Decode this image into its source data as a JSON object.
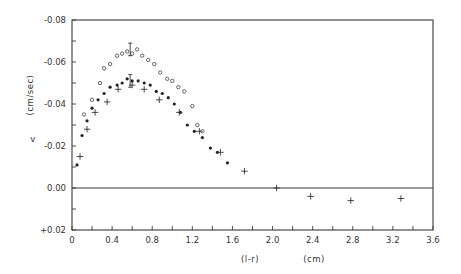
{
  "chart_data": {
    "type": "scatter",
    "title": "",
    "xlabel": "(l-r)",
    "xlabel_units": "(cm)",
    "ylabel": "v",
    "ylabel_units": "(cm/sec)",
    "xlim": [
      0,
      3.6
    ],
    "ylim": [
      0.02,
      -0.08
    ],
    "xticks": [
      0,
      0.4,
      0.8,
      1.2,
      1.6,
      2.0,
      2.4,
      2.8,
      3.2,
      3.6
    ],
    "xtick_labels": [
      "0",
      "0.4",
      "0.8",
      "1.2",
      "1.6",
      "2.0",
      "2.4",
      "2.8",
      "3.2",
      "3.6"
    ],
    "yticks": [
      -0.08,
      -0.06,
      -0.04,
      -0.02,
      0.0,
      0.02
    ],
    "ytick_labels": [
      "-0.08",
      "-0.06",
      "-0.04",
      "-0.02",
      "0.00",
      "+0.02"
    ],
    "grid": false,
    "zero_line": true,
    "legend": null,
    "series": [
      {
        "name": "open circles",
        "marker": "open-circle",
        "x": [
          0.12,
          0.2,
          0.28,
          0.32,
          0.38,
          0.45,
          0.5,
          0.55,
          0.6,
          0.65,
          0.7,
          0.76,
          0.82,
          0.88,
          0.95,
          1.0,
          1.06,
          1.12,
          1.2,
          1.25,
          1.3
        ],
        "y": [
          -0.035,
          -0.042,
          -0.05,
          -0.057,
          -0.059,
          -0.063,
          -0.064,
          -0.065,
          -0.064,
          -0.066,
          -0.063,
          -0.061,
          -0.059,
          -0.055,
          -0.052,
          -0.051,
          -0.048,
          -0.046,
          -0.039,
          -0.03,
          -0.027
        ]
      },
      {
        "name": "filled dots",
        "marker": "filled-dot",
        "x": [
          0.05,
          0.1,
          0.15,
          0.2,
          0.26,
          0.32,
          0.38,
          0.45,
          0.5,
          0.55,
          0.6,
          0.66,
          0.72,
          0.78,
          0.84,
          0.9,
          0.96,
          1.02,
          1.08,
          1.15,
          1.22,
          1.3,
          1.38,
          1.45,
          1.55
        ],
        "y": [
          -0.011,
          -0.025,
          -0.032,
          -0.038,
          -0.042,
          -0.045,
          -0.048,
          -0.049,
          -0.05,
          -0.052,
          -0.051,
          -0.051,
          -0.05,
          -0.049,
          -0.046,
          -0.045,
          -0.043,
          -0.04,
          -0.036,
          -0.03,
          -0.027,
          -0.024,
          -0.019,
          -0.017,
          -0.012
        ]
      },
      {
        "name": "crosses",
        "marker": "plus",
        "x": [
          0.08,
          0.15,
          0.23,
          0.35,
          0.46,
          0.6,
          0.72,
          0.87,
          1.07,
          1.27,
          1.48,
          1.72,
          2.04,
          2.38,
          2.78,
          3.28
        ],
        "y": [
          -0.015,
          -0.028,
          -0.036,
          -0.041,
          -0.047,
          -0.049,
          -0.047,
          -0.042,
          -0.036,
          -0.027,
          -0.017,
          -0.008,
          0.0,
          0.004,
          0.006,
          0.005
        ]
      }
    ],
    "error_bars": [
      {
        "series": "open circles",
        "x": 0.58,
        "y": -0.066,
        "low": -0.063,
        "high": -0.069
      },
      {
        "series": "filled dots",
        "x": 0.58,
        "y": -0.051,
        "low": -0.048,
        "high": -0.054
      }
    ]
  }
}
